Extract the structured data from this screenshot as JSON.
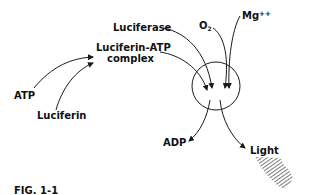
{
  "figure": {
    "caption": "FIG. 1-1",
    "labels": {
      "luciferase": "Luciferase",
      "oxygen": "O",
      "oxygen_subscript": "2",
      "magnesium": "Mg",
      "magnesium_superscript": "++",
      "complex_line1": "Luciferin-ATP",
      "complex_line2": "complex",
      "atp": "ATP",
      "luciferin": "Luciferin",
      "adp": "ADP",
      "light": "Light"
    }
  },
  "colors": {
    "ink": "#111111",
    "background": "#ffffff"
  }
}
